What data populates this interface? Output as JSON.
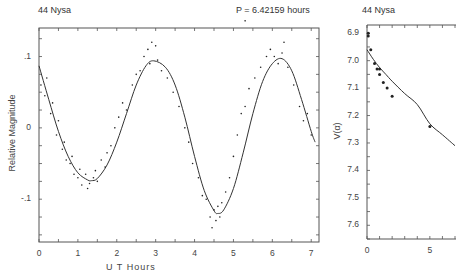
{
  "chart_data": [
    {
      "type": "scatter",
      "title": "44 Nysa",
      "subtitle": "P = 6.42159 hours",
      "xlabel": "U T  Hours",
      "ylabel": "Relative Magnitude",
      "xlim": [
        0,
        7.2
      ],
      "ylim": [
        0.14,
        -0.16
      ],
      "y_inverted": true,
      "x_ticks": [
        0,
        1,
        2,
        3,
        4,
        5,
        6,
        7
      ],
      "x_tick_labels": [
        "0",
        "1",
        "2",
        "3",
        "4",
        "5",
        "6",
        "7"
      ],
      "y_ticks": [
        -0.1,
        0,
        0.1
      ],
      "y_tick_labels": [
        "-.1",
        "0",
        ".1"
      ],
      "grid": false,
      "series": [
        {
          "name": "fit curve",
          "style": "line",
          "x": [
            0.0,
            0.25,
            0.5,
            0.75,
            1.0,
            1.25,
            1.35,
            1.5,
            1.75,
            2.0,
            2.25,
            2.5,
            2.75,
            2.95,
            3.25,
            3.5,
            3.75,
            4.0,
            4.25,
            4.5,
            4.6,
            4.75,
            5.0,
            5.25,
            5.5,
            5.75,
            6.0,
            6.25,
            6.5,
            6.75,
            7.0,
            7.1
          ],
          "y": [
            0.087,
            0.04,
            -0.005,
            -0.04,
            -0.063,
            -0.073,
            -0.074,
            -0.071,
            -0.052,
            -0.02,
            0.02,
            0.06,
            0.087,
            0.094,
            0.085,
            0.06,
            0.015,
            -0.04,
            -0.088,
            -0.116,
            -0.12,
            -0.115,
            -0.085,
            -0.035,
            0.02,
            0.065,
            0.09,
            0.097,
            0.08,
            0.04,
            -0.005,
            -0.02
          ]
        },
        {
          "name": "observations",
          "style": "points",
          "x": [
            0.05,
            0.15,
            0.2,
            0.3,
            0.35,
            0.45,
            0.5,
            0.6,
            0.65,
            0.7,
            0.8,
            0.85,
            0.9,
            1.0,
            1.05,
            1.1,
            1.2,
            1.25,
            1.3,
            1.4,
            1.45,
            1.5,
            1.6,
            1.7,
            1.75,
            1.85,
            1.95,
            2.05,
            2.15,
            2.25,
            2.4,
            2.5,
            2.6,
            2.7,
            2.8,
            2.85,
            2.9,
            3.0,
            3.05,
            3.15,
            3.3,
            3.45,
            3.6,
            3.75,
            3.85,
            3.95,
            4.1,
            4.2,
            4.3,
            4.4,
            4.45,
            4.5,
            4.55,
            4.6,
            4.65,
            4.7,
            4.8,
            4.9,
            5.0,
            5.1,
            5.2,
            5.3,
            5.4,
            5.55,
            5.7,
            5.85,
            5.95,
            6.05,
            6.15,
            6.25,
            6.3,
            6.4,
            6.55,
            6.7,
            6.8,
            6.9,
            7.0,
            5.3
          ],
          "y": [
            0.06,
            0.045,
            0.07,
            0.02,
            0.035,
            -0.01,
            0.01,
            -0.03,
            -0.02,
            -0.045,
            -0.05,
            -0.04,
            -0.065,
            -0.07,
            -0.058,
            -0.08,
            -0.065,
            -0.085,
            -0.078,
            -0.07,
            -0.06,
            -0.075,
            -0.045,
            -0.055,
            -0.035,
            -0.025,
            0.0,
            0.015,
            0.035,
            0.025,
            0.06,
            0.075,
            0.08,
            0.1,
            0.11,
            0.09,
            0.12,
            0.115,
            0.095,
            0.08,
            0.07,
            0.05,
            0.03,
            0.0,
            -0.02,
            -0.05,
            -0.07,
            -0.095,
            -0.1,
            -0.125,
            -0.14,
            -0.115,
            -0.13,
            -0.11,
            -0.125,
            -0.105,
            -0.09,
            -0.07,
            -0.04,
            -0.01,
            0.02,
            0.03,
            0.055,
            0.07,
            0.085,
            0.1,
            0.11,
            0.1,
            0.09,
            0.105,
            0.12,
            0.085,
            0.06,
            0.03,
            0.01,
            0.02,
            -0.01,
            0.15
          ]
        }
      ]
    },
    {
      "type": "scatter",
      "title": "44 Nysa",
      "xlabel": "",
      "ylabel": "V(α)",
      "xlim": [
        0,
        7.0
      ],
      "ylim": [
        6.87,
        7.65
      ],
      "y_inverted": true,
      "x_ticks": [
        0,
        5
      ],
      "x_tick_labels": [
        "0",
        "5"
      ],
      "y_ticks": [
        6.9,
        7.0,
        7.1,
        7.2,
        7.3,
        7.4,
        7.5,
        7.6
      ],
      "y_tick_labels": [
        "6.9",
        "7.0",
        "7.1",
        "7.2",
        "7.3",
        "7.4",
        "7.5",
        "7.6"
      ],
      "grid": false,
      "series": [
        {
          "name": "phase curve fit",
          "style": "line",
          "x": [
            0,
            0.5,
            1,
            1.5,
            2,
            3,
            4,
            5,
            6,
            7
          ],
          "y": [
            6.96,
            6.995,
            7.025,
            7.05,
            7.075,
            7.12,
            7.16,
            7.23,
            7.27,
            7.31
          ]
        },
        {
          "name": "observations",
          "style": "points",
          "x": [
            0.1,
            0.1,
            0.3,
            0.6,
            0.8,
            1.0,
            1.0,
            1.3,
            1.6,
            2.0,
            5.0
          ],
          "y": [
            6.9,
            6.91,
            6.96,
            7.01,
            7.03,
            7.03,
            7.05,
            7.08,
            7.1,
            7.13,
            7.24
          ]
        }
      ]
    }
  ],
  "left_panel": {
    "title": "44 Nysa",
    "period_label": "P = 6.42159 hours",
    "xlabel": "U T  Hours",
    "ylabel": "Relative Magnitude"
  },
  "right_panel": {
    "title": "44 Nysa",
    "ylabel": "V(α)"
  }
}
